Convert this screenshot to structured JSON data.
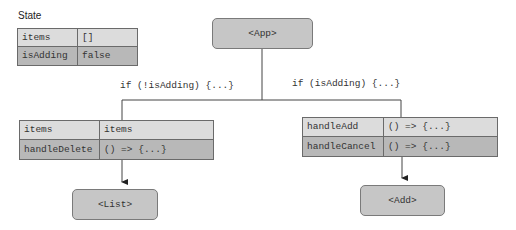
{
  "state": {
    "title": "State",
    "rows": [
      {
        "key": "items",
        "value": "[]"
      },
      {
        "key": "isAdding",
        "value": "false"
      }
    ]
  },
  "nodes": {
    "app": "<App>",
    "list": "<List>",
    "add": "<Add>"
  },
  "conditions": {
    "left": "if (!isAdding) {...}",
    "right": "if (isAdding) {...}"
  },
  "list_props": [
    {
      "key": "items",
      "value": "items"
    },
    {
      "key": "handleDelete",
      "value": "() => {...}"
    }
  ],
  "add_props": [
    {
      "key": "handleAdd",
      "value": "() => {...}"
    },
    {
      "key": "handleCancel",
      "value": "() => {...}"
    }
  ],
  "colors": {
    "node_fill": "#c6c6c6",
    "row_light": "#dcdcdc",
    "row_dark": "#b8b8b8",
    "line": "#444444"
  }
}
